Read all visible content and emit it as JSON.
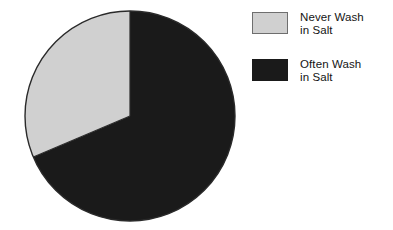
{
  "chart_data": {
    "type": "pie",
    "title": "",
    "subtitle": "",
    "xlabel": "",
    "ylabel": "",
    "grid": false,
    "legend_position": "right",
    "start_angle_deg": 0,
    "direction": "counterclockwise",
    "center": {
      "x": 130,
      "y": 116
    },
    "radius": 105,
    "categories": [
      "Never Wash in Salt",
      "Often Wash in Salt"
    ],
    "values": [
      31,
      69
    ],
    "slices": [
      {
        "label_line1": "Never Wash",
        "label_line2": "in Salt",
        "label": "Never Wash in Salt",
        "value": 31,
        "sweep_deg": 113,
        "color": "#d0d0d0",
        "edge_color": "#6e6e6e"
      },
      {
        "label_line1": "Often Wash",
        "label_line2": "in Salt",
        "label": "Often Wash in Salt",
        "value": 69,
        "sweep_deg": 247,
        "color": "#1a1a1a",
        "edge_color": "#1a1a1a"
      }
    ]
  },
  "legend": {
    "entries": [
      {
        "swatch_name": "never-wash-swatch",
        "line1": "Never Wash",
        "line2": "in Salt"
      },
      {
        "swatch_name": "often-wash-swatch",
        "line1": "Often Wash",
        "line2": "in Salt"
      }
    ]
  },
  "colors": {
    "light_slice": "#d0d0d0",
    "dark_slice": "#1a1a1a",
    "outline": "#2a2a2a",
    "background": "#ffffff",
    "text": "#141414"
  }
}
